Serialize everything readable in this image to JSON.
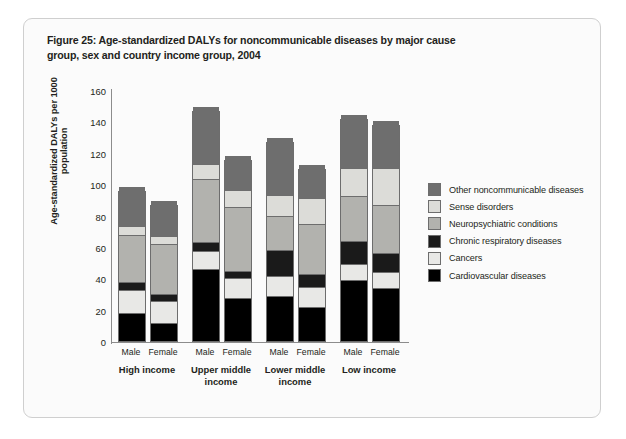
{
  "figure": {
    "title": "Figure 25: Age-standardized DALYs for noncommunicable diseases by major cause group, sex and country income group, 2004"
  },
  "chart_data": {
    "type": "bar",
    "stacked": true,
    "title": "Figure 25: Age-standardized DALYs for noncommunicable diseases by major cause group, sex and country income group, 2004",
    "xlabel": "",
    "ylabel": "Age-standardized DALYs per 1000 population",
    "ylim": [
      0,
      160
    ],
    "yticks": [
      0,
      20,
      40,
      60,
      80,
      100,
      120,
      140,
      160
    ],
    "ytick_labels": [
      "0",
      "20",
      "40",
      "60",
      "80",
      "100",
      "120",
      "140",
      "160"
    ],
    "grid": false,
    "legend_position": "right",
    "categories": [
      "High income – Male",
      "High income – Female",
      "Upper middle income – Male",
      "Upper middle income – Female",
      "Lower middle income – Male",
      "Lower middle income – Female",
      "Low income – Male",
      "Low income – Female"
    ],
    "groups": [
      {
        "label": "High income",
        "bars": [
          {
            "sex": "Male",
            "total": 95,
            "values": [
              17,
              14,
              5,
              29,
              5,
              25
            ]
          },
          {
            "sex": "Female",
            "total": 86,
            "values": [
              11,
              13,
              4,
              31,
              5,
              22
            ]
          }
        ]
      },
      {
        "label": "Upper middle income",
        "bars": [
          {
            "sex": "Male",
            "total": 146,
            "values": [
              45,
              11,
              5,
              40,
              9,
              36
            ]
          },
          {
            "sex": "Female",
            "total": 115,
            "values": [
              27,
              12,
              4,
              40,
              10,
              22
            ]
          }
        ]
      },
      {
        "label": "Lower middle income",
        "bars": [
          {
            "sex": "Male",
            "total": 126,
            "values": [
              28,
              12,
              16,
              21,
              13,
              36
            ]
          },
          {
            "sex": "Female",
            "total": 109,
            "values": [
              21,
              12,
              8,
              31,
              16,
              21
            ]
          }
        ]
      },
      {
        "label": "Low income",
        "bars": [
          {
            "sex": "Male",
            "total": 141,
            "values": [
              38,
              10,
              14,
              28,
              17,
              34
            ]
          },
          {
            "sex": "Female",
            "total": 137,
            "values": [
              33,
              10,
              11,
              30,
              23,
              30
            ]
          }
        ]
      }
    ],
    "series": [
      {
        "name": "Cardiovascular diseases",
        "color": "#000000",
        "values": [
          17,
          11,
          45,
          27,
          28,
          21,
          38,
          33
        ]
      },
      {
        "name": "Cancers",
        "color": "#e8e8e6",
        "values": [
          14,
          13,
          11,
          12,
          12,
          12,
          10,
          10
        ]
      },
      {
        "name": "Chronic respiratory diseases",
        "color": "#1a1a1a",
        "values": [
          5,
          4,
          5,
          4,
          16,
          8,
          14,
          11
        ]
      },
      {
        "name": "Neuropsychiatric conditions",
        "color": "#b2b2ae",
        "values": [
          29,
          31,
          40,
          40,
          21,
          31,
          28,
          30
        ]
      },
      {
        "name": "Sense disorders",
        "color": "#dcdcd8",
        "values": [
          5,
          5,
          9,
          10,
          13,
          16,
          17,
          23
        ]
      },
      {
        "name": "Other noncommunicable diseases",
        "color": "#6e6e6e",
        "values": [
          25,
          22,
          36,
          22,
          36,
          21,
          34,
          30
        ]
      }
    ]
  },
  "legend": {
    "items": [
      {
        "label": "Other noncommunicable diseases",
        "color": "#6e6e6e"
      },
      {
        "label": "Sense disorders",
        "color": "#dcdcd8"
      },
      {
        "label": "Neuropsychiatric conditions",
        "color": "#b2b2ae"
      },
      {
        "label": "Chronic respiratory diseases",
        "color": "#1a1a1a"
      },
      {
        "label": "Cancers",
        "color": "#e8e8e6"
      },
      {
        "label": "Cardiovascular diseases",
        "color": "#000000"
      }
    ]
  }
}
